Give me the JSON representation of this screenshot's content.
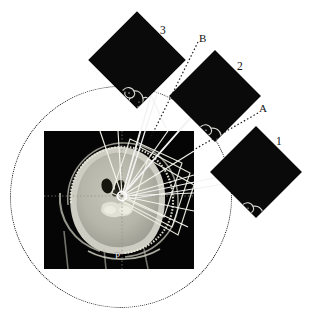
{
  "figure": {
    "type": "stereotactic-angiography-composite",
    "background_color": "#ffffff",
    "ink_color": "#111111"
  },
  "ct_panel": {
    "name": "axial-ct-slice",
    "x": 44,
    "y": 131,
    "width": 150,
    "height": 138,
    "background_color": "#050505",
    "brain_fill": "#b9b9af",
    "skull_color": "#e8e8e0",
    "orientation_markers": [
      {
        "letter": "P",
        "meaning": "posterior",
        "x": 117,
        "y": 257
      }
    ],
    "target_marker": {
      "name": "isocenter-target",
      "x": 122,
      "y": 196,
      "radius": 4,
      "color": "#ffffff"
    },
    "crosshair": {
      "color": "#8e8e86",
      "style": "dotted"
    },
    "frame_arc": {
      "name": "stereotactic-ring",
      "color": "#dcdcd4"
    },
    "beam_lines_count": 7,
    "beam_color": "#f5f5f0"
  },
  "guidance_circle": {
    "name": "gantry-rotation-circle",
    "center_x": 120,
    "center_y": 196,
    "radius": 110,
    "style": "dotted",
    "color": "#0b0b0b"
  },
  "angio_panels": [
    {
      "id": "panel-1",
      "label": "1",
      "label_x": 276,
      "label_y": 136,
      "center_x": 256,
      "center_y": 172,
      "size": 64,
      "rotation_deg": 45,
      "background_color": "#0a0a0a",
      "vessel_color": "#d8d8d2",
      "description": "angiographic projection 1"
    },
    {
      "id": "panel-2",
      "label": "2",
      "label_x": 237,
      "label_y": 61,
      "center_x": 215,
      "center_y": 96,
      "size": 64,
      "rotation_deg": 45,
      "background_color": "#0a0a0a",
      "vessel_color": "#d8d8d2",
      "description": "angiographic projection 2"
    },
    {
      "id": "panel-3",
      "label": "3",
      "label_x": 160,
      "label_y": 25,
      "center_x": 137,
      "center_y": 60,
      "size": 68,
      "rotation_deg": 45,
      "background_color": "#0a0a0a",
      "vessel_color": "#d8d8d2",
      "description": "angiographic projection 3"
    }
  ],
  "reference_labels": [
    {
      "id": "label-a",
      "text": "A",
      "x": 259,
      "y": 103,
      "leader_to_x": 150,
      "leader_to_y": 178
    },
    {
      "id": "label-b",
      "text": "B",
      "x": 199,
      "y": 33,
      "leader_to_x": 135,
      "leader_to_y": 186
    }
  ],
  "leader_lines": [
    {
      "from": "panel-3",
      "to": "target",
      "style": "solid",
      "color": "#f2f2f2"
    },
    {
      "from": "panel-2",
      "to": "target",
      "style": "solid",
      "color": "#f2f2f2"
    },
    {
      "from": "panel-1",
      "to": "target",
      "style": "solid",
      "color": "#f2f2f2"
    },
    {
      "from": "label-b",
      "to": "target",
      "style": "dotted",
      "color": "#1a1a1a"
    },
    {
      "from": "label-a",
      "to": "target",
      "style": "dotted",
      "color": "#1a1a1a"
    }
  ]
}
